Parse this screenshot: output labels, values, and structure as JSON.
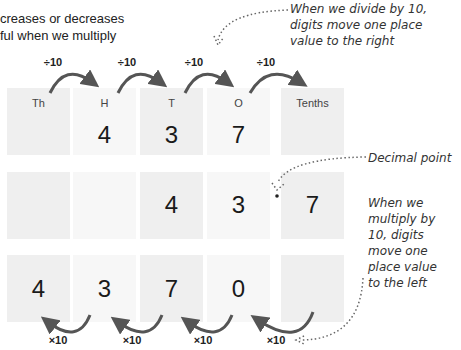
{
  "intro": {
    "line1": "creases or decreases",
    "line2": "ful when we multiply"
  },
  "notes": {
    "divide": [
      "When we divide by 10,",
      "digits move one place",
      "value to the right"
    ],
    "decimal_point": "Decimal point",
    "multiply": [
      "When we",
      "multiply by",
      "10, digits",
      "move one",
      "place value",
      "to the left"
    ]
  },
  "columns": [
    "Th",
    "H",
    "T",
    "O",
    "Tenths"
  ],
  "rows": [
    [
      "",
      "4",
      "3",
      "7",
      ""
    ],
    [
      "",
      "",
      "4",
      "3",
      "7"
    ],
    [
      "4",
      "3",
      "7",
      "0",
      ""
    ]
  ],
  "operators": {
    "divide": [
      "÷10",
      "÷10",
      "÷10",
      "÷10"
    ],
    "multiply": [
      "×10",
      "×10",
      "×10",
      "×10"
    ]
  },
  "colors": {
    "arrow": "#555555",
    "cell_dark": "#efefef",
    "cell_light": "#f7f7f7"
  }
}
